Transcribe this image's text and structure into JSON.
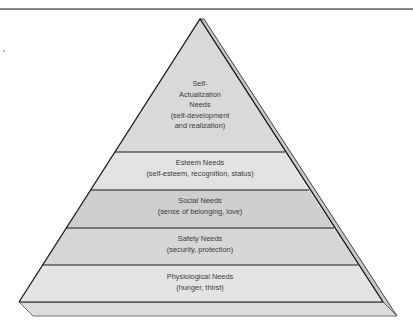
{
  "diagram": {
    "type": "pyramid",
    "levels": [
      {
        "name": "Self-Actualization Needs",
        "lines": [
          "Self-",
          "Actualization",
          "Needs",
          "(self-development",
          "and realization)"
        ],
        "fill": "#d9d9d9"
      },
      {
        "name": "Esteem Needs",
        "lines": [
          "Esteem Needs",
          "(self-esteem, recognition, status)"
        ],
        "fill": "#e3e3e3"
      },
      {
        "name": "Social Needs",
        "lines": [
          "Social Needs",
          "(sense of belonging, love)"
        ],
        "fill": "#cfcfcf"
      },
      {
        "name": "Safety Needs",
        "lines": [
          "Safety Needs",
          "(security, protection)"
        ],
        "fill": "#d6d6d6"
      },
      {
        "name": "Physiological Needs",
        "lines": [
          "Physiological Needs",
          "(hunger, thirst)"
        ],
        "fill": "#e4e4e4"
      }
    ],
    "colors": {
      "outline": "#1a1a1a",
      "side_face": "#c8c8c8",
      "base_face": "#dcdcdc",
      "text": "#3a3a3a",
      "rule": "#7a7a7a"
    }
  }
}
